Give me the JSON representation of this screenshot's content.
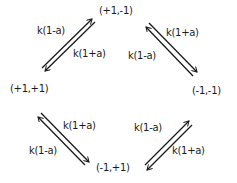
{
  "nodes": {
    "top": "(+1,-1)",
    "left": "(+1,+1)",
    "right": "(-1,-1)",
    "bottom": "(-1,+1)"
  },
  "edges": {
    "top_left": {
      "outer": "k(1-a)",
      "inner": "k(1+a)"
    },
    "top_right": {
      "outer": "k(1+a)",
      "inner": "k(1-a)"
    },
    "bottom_left": {
      "outer": "k(1-a)",
      "inner": "k(1+a)"
    },
    "bottom_right": {
      "outer": "k(1+a)",
      "inner": "k(1-a)"
    }
  },
  "colors": {
    "ink": "#1a1a1a",
    "background": "#ffffff"
  }
}
